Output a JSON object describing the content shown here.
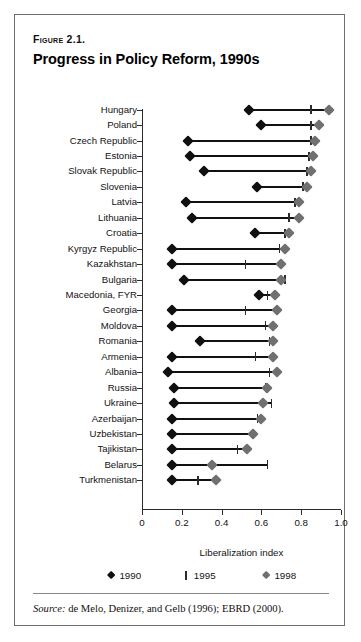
{
  "figure": {
    "number": "Figure 2.1.",
    "title": "Progress in Policy Reform, 1990s",
    "source_prefix": "Source:",
    "source_text": " de Melo, Denizer, and Gelb (1996); EBRD (2000)."
  },
  "legend": {
    "items": [
      {
        "label": "1990",
        "marker": "diamond-black-icon",
        "color": "#101010"
      },
      {
        "label": "1995",
        "marker": "tick-bar-icon",
        "color": "#2c2c2c"
      },
      {
        "label": "1998",
        "marker": "diamond-gray-icon",
        "color": "#707070"
      }
    ]
  },
  "chart_data": {
    "type": "line",
    "title": "Progress in Policy Reform, 1990s",
    "xlabel": "Liberalization index",
    "ylabel": "",
    "xlim": [
      0,
      1.0
    ],
    "xticks": [
      0,
      0.2,
      0.4,
      0.6,
      0.8,
      1.0
    ],
    "xticklabels": [
      "0",
      "0.2",
      "0.4",
      "0.6",
      "0.8",
      "1.0"
    ],
    "grid": false,
    "legend_position": "below-axes",
    "categories": [
      "Hungary",
      "Poland",
      "Czech Republic",
      "Estonia",
      "Slovak Republic",
      "Slovenia",
      "Latvia",
      "Lithuania",
      "Croatia",
      "Kyrgyz Republic",
      "Kazakhstan",
      "Bulgaria",
      "Macedonia, FYR",
      "Georgia",
      "Moldova",
      "Romania",
      "Armenia",
      "Albania",
      "Russia",
      "Ukraine",
      "Azerbaijan",
      "Uzbekistan",
      "Tajikistan",
      "Belarus",
      "Turkmenistan"
    ],
    "series": [
      {
        "name": "1990",
        "marker": "diamond",
        "color": "#101010",
        "values": [
          0.54,
          0.6,
          0.23,
          0.24,
          0.31,
          0.58,
          0.22,
          0.25,
          0.57,
          0.15,
          0.15,
          0.21,
          0.59,
          0.15,
          0.15,
          0.29,
          0.15,
          0.13,
          0.16,
          0.16,
          0.15,
          0.15,
          0.15,
          0.15,
          0.15
        ]
      },
      {
        "name": "1995",
        "marker": "tick",
        "color": "#2c2c2c",
        "values": [
          0.85,
          0.85,
          0.85,
          0.84,
          0.83,
          0.81,
          0.77,
          0.74,
          0.72,
          0.69,
          0.52,
          0.72,
          0.63,
          0.52,
          0.62,
          0.64,
          0.57,
          0.64,
          0.62,
          0.65,
          0.58,
          0.56,
          0.48,
          0.63,
          0.28
        ]
      },
      {
        "name": "1998",
        "marker": "diamond",
        "color": "#707070",
        "values": [
          0.94,
          0.89,
          0.87,
          0.86,
          0.85,
          0.83,
          0.79,
          0.79,
          0.74,
          0.72,
          0.7,
          0.7,
          0.67,
          0.68,
          0.66,
          0.66,
          0.66,
          0.68,
          0.63,
          0.61,
          0.6,
          0.56,
          0.53,
          0.35,
          0.37
        ]
      }
    ]
  }
}
